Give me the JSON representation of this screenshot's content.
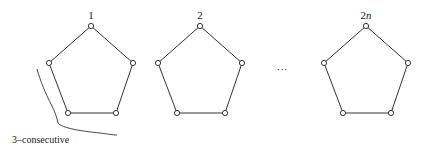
{
  "diagram": {
    "graphs": [
      {
        "label": "1",
        "label_italic_suffix": "",
        "vertex_count": 5
      },
      {
        "label": "2",
        "label_italic_suffix": "",
        "vertex_count": 5
      },
      {
        "label": "2",
        "label_italic_suffix": "n",
        "vertex_count": 5
      }
    ],
    "ellipsis": "···",
    "annotation": "3–consecutive",
    "annotated_graph_index": 0
  }
}
